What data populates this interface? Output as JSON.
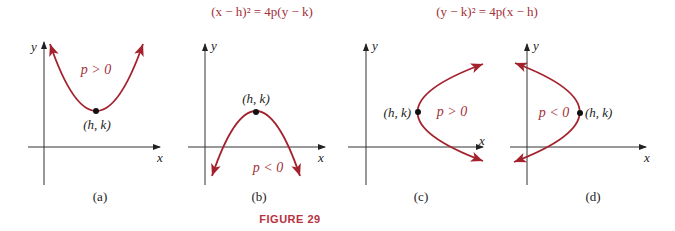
{
  "equations": {
    "vertical": "(x − h)² = 4p(y − k)",
    "horizontal": "(y − k)² = 4p(x − h)"
  },
  "panels": [
    {
      "id": "a",
      "caption": "(a)",
      "condition": "p > 0",
      "vertex_label": "(h, k)",
      "x_axis": "x",
      "y_axis": "y",
      "opens": "up"
    },
    {
      "id": "b",
      "caption": "(b)",
      "condition": "p < 0",
      "vertex_label": "(h, k)",
      "x_axis": "x",
      "y_axis": "y",
      "opens": "down"
    },
    {
      "id": "c",
      "caption": "(c)",
      "condition": "p > 0",
      "vertex_label": "(h, k)",
      "x_axis": "x",
      "y_axis": "y",
      "opens": "right"
    },
    {
      "id": "d",
      "caption": "(d)",
      "condition": "p < 0",
      "vertex_label": "(h, k)",
      "x_axis": "x",
      "y_axis": "y",
      "opens": "left"
    }
  ],
  "figure_label": "FIGURE 29",
  "colors": {
    "curve": "#a3222e",
    "equation_text": "#a3303a",
    "figure_label": "#b8323e",
    "axes": "#333333"
  }
}
